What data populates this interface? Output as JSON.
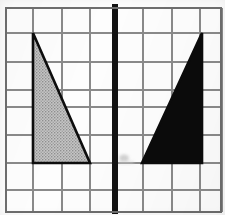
{
  "figure": {
    "canvas": {
      "width": 225,
      "height": 215,
      "background": "#fdfdfd"
    }
  },
  "grid": {
    "label": "square grid",
    "line_color": "#8a8a8a",
    "line_width": 1.3,
    "border_color": "#6e6e6e",
    "border_width": 1.6,
    "vertical_lines_x": [
      6,
      33,
      62,
      90,
      115,
      143,
      172,
      200,
      222
    ],
    "horizontal_lines_y": [
      8,
      33,
      62,
      90,
      107,
      135,
      163,
      190,
      212
    ],
    "columns": 8,
    "rows": 8,
    "cell_width": 28,
    "cell_height": 27
  },
  "mirror_line": {
    "label": "line of reflection",
    "orientation": "vertical",
    "x": 115,
    "y_top": 4,
    "y_bottom": 214,
    "color": "#121212",
    "width": 6
  },
  "shapes": [
    {
      "id": "left-triangle",
      "name": "pre-image triangle",
      "type": "right-triangle",
      "fill": "#b4b4b4",
      "fill_style": "halftone-gray",
      "stroke": "#0d0d0d",
      "stroke_width": 2.6,
      "vertices": [
        {
          "x": 33,
          "y": 33
        },
        {
          "x": 33,
          "y": 163
        },
        {
          "x": 90,
          "y": 163
        }
      ],
      "legs": {
        "vertical": 130,
        "horizontal": 57
      },
      "right_angle_at": {
        "x": 33,
        "y": 163
      }
    },
    {
      "id": "right-triangle",
      "name": "reflected image triangle",
      "type": "right-triangle",
      "fill": "#0b0b0b",
      "fill_style": "solid-black",
      "stroke": "#0b0b0b",
      "stroke_width": 2.6,
      "vertices": [
        {
          "x": 202,
          "y": 33
        },
        {
          "x": 202,
          "y": 163
        },
        {
          "x": 142,
          "y": 163
        }
      ],
      "legs": {
        "vertical": 130,
        "horizontal": 60
      },
      "right_angle_at": {
        "x": 202,
        "y": 163
      }
    }
  ],
  "artifacts": [
    {
      "id": "scan-smudge",
      "name": "scan smudge near mirror line",
      "x": 120,
      "y": 155,
      "width": 14,
      "height": 10,
      "color": "#b9b9b9"
    }
  ],
  "colors": {
    "gray_fill": "#b4b4b4",
    "black_fill": "#0b0b0b",
    "grid_line": "#8a8a8a",
    "mirror": "#121212",
    "paper": "#fdfdfd"
  }
}
